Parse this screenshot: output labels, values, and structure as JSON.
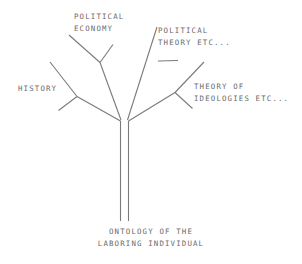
{
  "diagram": {
    "type": "tree",
    "background_color": "#ffffff",
    "line_color": "#7a7a7a",
    "text_color": "#6b6b6b",
    "root": {
      "id": "root",
      "line1": "ONTOLOGY OF THE",
      "line2": "LABORING INDIVIDUAL"
    },
    "branches": [
      {
        "id": "political-economy",
        "line1": "POLITICAL",
        "line2": "ECONOMY",
        "position": "top-left"
      },
      {
        "id": "political-theory",
        "line1": "POLITICAL",
        "line2": "THEORY ETC...",
        "position": "top-right"
      },
      {
        "id": "history",
        "line1": "HISTORY",
        "line2": "",
        "position": "left"
      },
      {
        "id": "theory-of-ideologies",
        "line1": "THEORY OF",
        "line2": "IDEOLOGIES ETC...",
        "position": "right"
      }
    ]
  }
}
